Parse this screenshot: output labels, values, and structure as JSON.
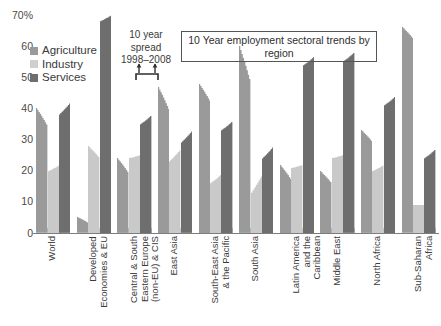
{
  "chart_data": {
    "type": "area",
    "title": "10 Year employment sectoral trends by region",
    "xlabel": "",
    "ylabel": "70%",
    "ylim": [
      0,
      70
    ],
    "yticks": [
      0,
      10,
      20,
      30,
      40,
      50,
      60,
      70
    ],
    "ytick_labels": [
      "0",
      "10",
      "20",
      "30",
      "40",
      "50",
      "60",
      "70%"
    ],
    "grid": false,
    "legend_position": "top-left",
    "legend": [
      "Agriculture",
      "Industry",
      "Services"
    ],
    "series_colors": {
      "Agriculture": "#9a9a9a",
      "Industry": "#c9c9c9",
      "Services": "#6e6e6e"
    },
    "annotations": [
      {
        "name": "spread-note",
        "text_line1": "10 year",
        "text_line2": "spread",
        "text_line3": "1998–2008"
      },
      {
        "name": "title-box",
        "text": "10 Year employment sectoral trends by region"
      }
    ],
    "note": "Each bar is a 10-year spread area: left edge = 1998 value, right edge = 2008 value.",
    "categories": [
      "World",
      "Developed Economies & EU",
      "Central & South Eastern Europe (non-EU) & CIS",
      "East Asia",
      "South-East Asia & the Pacific",
      "South Asia",
      "Latin America and the Caribbean",
      "Middle East",
      "North Africa",
      "Sub-Saharan Africa"
    ],
    "series": [
      {
        "name": "Agriculture",
        "start_1998": [
          40,
          5,
          24,
          47,
          48,
          60,
          22,
          20,
          33,
          66
        ],
        "end_2008": [
          34,
          3,
          19,
          39,
          42,
          48,
          17,
          16,
          29,
          62
        ]
      },
      {
        "name": "Industry",
        "start_1998": [
          20,
          28,
          24,
          23,
          16,
          13,
          21,
          24,
          20,
          9
        ],
        "end_2008": [
          22,
          24,
          25,
          27,
          19,
          19,
          22,
          25,
          22,
          9
        ]
      },
      {
        "name": "Services",
        "start_1998": [
          38,
          68,
          35,
          29,
          33,
          24,
          54,
          55,
          41,
          24
        ]
      }
    ]
  },
  "y_axis": {
    "ticks": [
      {
        "value": 70,
        "label": "70%"
      },
      {
        "value": 60,
        "label": "60"
      },
      {
        "value": 50,
        "label": "50"
      },
      {
        "value": 40,
        "label": "40"
      },
      {
        "value": 30,
        "label": "30"
      },
      {
        "value": 20,
        "label": "20"
      },
      {
        "value": 10,
        "label": "10"
      },
      {
        "value": 0,
        "label": "0"
      }
    ]
  },
  "legend": {
    "items": [
      {
        "label": "Agriculture",
        "color": "#9a9a9a"
      },
      {
        "label": "Industry",
        "color": "#c9c9c9"
      },
      {
        "label": "Services",
        "color": "#6e6e6e"
      }
    ]
  },
  "annotations": {
    "spread_line1": "10 year",
    "spread_line2": "spread",
    "spread_line3": "1998–2008",
    "title_box": "10 Year employment sectoral trends by region"
  },
  "x_axis": {
    "labels": [
      "World",
      "Developed\nEconomies & EU",
      "Central & South\nEastern Europe\n(non-EU) & CIS",
      "East Asia",
      "South-East Asia\n& the Pacific",
      "South Asia",
      "Latin America\nand the\nCaribbean",
      "Middle East",
      "North Africa",
      "Sub-Saharan\nAfrica"
    ]
  }
}
